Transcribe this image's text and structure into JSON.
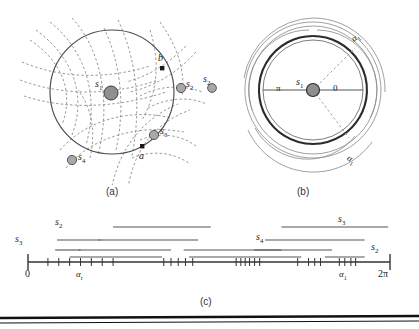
{
  "figure": {
    "panels": [
      {
        "id": "a",
        "caption": "(a)",
        "labels": [
          {
            "name": "s1",
            "text": "s",
            "sub": "1"
          },
          {
            "name": "s2",
            "text": "s",
            "sub": "2"
          },
          {
            "name": "s3",
            "text": "s",
            "sub": "3"
          },
          {
            "name": "s4",
            "text": "s",
            "sub": "4"
          },
          {
            "name": "point-a",
            "text": "a",
            "sub": ""
          },
          {
            "name": "point-b",
            "text": "b",
            "sub": ""
          }
        ]
      },
      {
        "id": "b",
        "caption": "(b)",
        "labels": [
          {
            "name": "s1",
            "text": "s",
            "sub": "1"
          },
          {
            "name": "s2",
            "text": "s",
            "sub": "2"
          },
          {
            "name": "alpha-upper",
            "text": "α",
            "sub": "1"
          },
          {
            "name": "alpha-lower",
            "text": "α",
            "sub": "1"
          },
          {
            "name": "angle-pi",
            "text": "π",
            "sub": ""
          },
          {
            "name": "angle-zero",
            "text": "0",
            "sub": ""
          }
        ]
      },
      {
        "id": "c",
        "caption": "(c)",
        "axis": {
          "start_label": "0",
          "end_label": "2π",
          "tick_labels": [
            {
              "name": "alpha-r",
              "text": "α",
              "sub": "r",
              "x": 0.205
            },
            {
              "name": "alpha-1",
              "text": "α",
              "sub": "1",
              "x": 0.865
            }
          ],
          "ticks": [
            0.055,
            0.085,
            0.115,
            0.145,
            0.175,
            0.205,
            0.235,
            0.375,
            0.395,
            0.415,
            0.435,
            0.455,
            0.575,
            0.588,
            0.6,
            0.612,
            0.626,
            0.64,
            0.745,
            0.775,
            0.792,
            0.808,
            0.86,
            0.875,
            0.892,
            0.905
          ]
        },
        "interval_labels": [
          {
            "name": "s2-left",
            "text": "s",
            "sub": "2"
          },
          {
            "name": "s3-left",
            "text": "s",
            "sub": "3"
          },
          {
            "name": "s4-mid",
            "text": "s",
            "sub": "4"
          },
          {
            "name": "s3-right",
            "text": "s",
            "sub": "3"
          },
          {
            "name": "s2-right",
            "text": "s",
            "sub": "2"
          }
        ],
        "bars": [
          {
            "row": 0,
            "x1": 0.235,
            "x2": 0.505
          },
          {
            "row": 0,
            "x1": 0.7,
            "x2": 0.995
          },
          {
            "row": 1,
            "x1": 0.08,
            "x2": 0.2
          },
          {
            "row": 1,
            "x1": 0.195,
            "x2": 0.47
          },
          {
            "row": 1,
            "x1": 0.655,
            "x2": 0.93
          },
          {
            "row": 2,
            "x1": 0.075,
            "x2": 0.145
          },
          {
            "row": 2,
            "x1": 0.14,
            "x2": 0.395
          },
          {
            "row": 2,
            "x1": 0.43,
            "x2": 0.7
          },
          {
            "row": 2,
            "x1": 0.625,
            "x2": 0.84
          },
          {
            "row": 3,
            "x1": 0.115,
            "x2": 0.37
          },
          {
            "row": 3,
            "x1": 0.445,
            "x2": 0.755
          },
          {
            "row": 3,
            "x1": 0.82,
            "x2": 0.93
          }
        ]
      }
    ]
  },
  "colors": {
    "line": "#333333",
    "dashed": "#8c8c8c",
    "marker_fill": "#9a9a9a",
    "marker_stroke": "#4a4a4a",
    "bar": "#555555",
    "rule": "#111111"
  }
}
